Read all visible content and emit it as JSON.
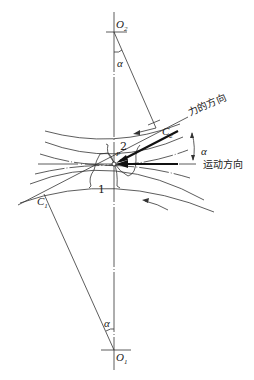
{
  "diagram": {
    "points": {
      "O2": {
        "label": "O",
        "sub": "2"
      },
      "O1": {
        "label": "O",
        "sub": "1"
      },
      "C2": {
        "label": "C",
        "sub": "2"
      },
      "C1": {
        "label": "C",
        "sub": "1"
      },
      "P": {
        "label": "P"
      }
    },
    "angles": {
      "top": "α",
      "bottom": "α",
      "right": "α"
    },
    "gears": {
      "upper": "2",
      "lower": "1"
    },
    "annotations": {
      "force_direction": "力的方向",
      "motion_direction": "运动方向"
    },
    "colors": {
      "line": "#333333",
      "thick": "#111111",
      "background": "#ffffff"
    }
  }
}
